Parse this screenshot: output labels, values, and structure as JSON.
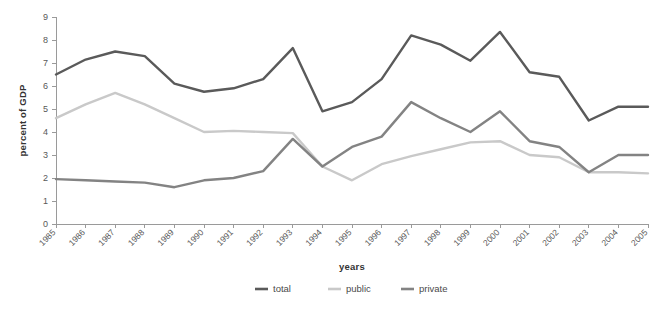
{
  "chart_data": {
    "type": "line",
    "title": "",
    "xlabel": "years",
    "ylabel": "percent of GDP",
    "categories": [
      "1985",
      "1986",
      "1987",
      "1988",
      "1989",
      "1990",
      "1991",
      "1992",
      "1993",
      "1994",
      "1995",
      "1996",
      "1997",
      "1998",
      "1999",
      "2000",
      "2001",
      "2002",
      "2003",
      "2004",
      "2005"
    ],
    "x": [
      1985,
      1986,
      1987,
      1988,
      1989,
      1990,
      1991,
      1992,
      1993,
      1994,
      1995,
      1996,
      1997,
      1998,
      1999,
      2000,
      2001,
      2002,
      2003,
      2004,
      2005
    ],
    "ylim": [
      0,
      9
    ],
    "xlim": [
      "1985",
      "2005"
    ],
    "yticks": [
      0,
      1,
      2,
      3,
      4,
      5,
      6,
      7,
      8,
      9
    ],
    "grid": false,
    "legend_position": "bottom",
    "series": [
      {
        "name": "total",
        "color": "#5a5a5a",
        "values": [
          6.5,
          7.15,
          7.5,
          7.3,
          6.1,
          5.75,
          5.9,
          6.3,
          7.65,
          4.9,
          5.3,
          6.3,
          8.2,
          7.8,
          7.1,
          8.35,
          6.6,
          6.4,
          4.5,
          5.1,
          5.1
        ]
      },
      {
        "name": "public",
        "color": "#c9c9c9",
        "values": [
          4.6,
          5.2,
          5.7,
          5.2,
          4.6,
          4.0,
          4.05,
          4.0,
          3.95,
          2.5,
          1.9,
          2.6,
          2.95,
          3.25,
          3.55,
          3.6,
          3.0,
          2.9,
          2.25,
          2.25,
          2.2
        ]
      },
      {
        "name": "private",
        "color": "#838383",
        "values": [
          1.95,
          1.9,
          1.85,
          1.8,
          1.6,
          1.9,
          2.0,
          2.3,
          3.7,
          2.5,
          3.35,
          3.8,
          5.3,
          4.6,
          4.0,
          4.9,
          3.6,
          3.35,
          2.25,
          3.0,
          3.0
        ]
      }
    ]
  },
  "legend": {
    "items": [
      {
        "label": "total",
        "color": "#5a5a5a"
      },
      {
        "label": "public",
        "color": "#c9c9c9"
      },
      {
        "label": "private",
        "color": "#838383"
      }
    ]
  }
}
